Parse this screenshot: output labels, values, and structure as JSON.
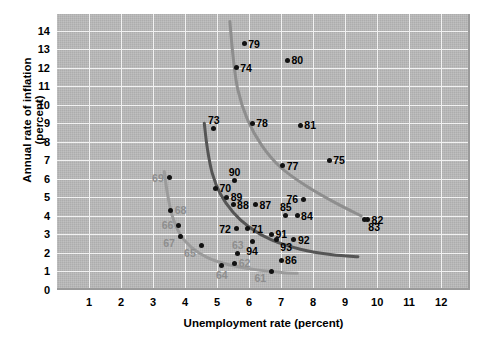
{
  "chart_data": {
    "type": "scatter",
    "title": "",
    "xlabel": "Unemployment rate (percent)",
    "ylabel": "Annual rate of inflation (percent)",
    "xlim": [
      0,
      12.9
    ],
    "ylim": [
      0,
      14.9
    ],
    "xticks": [
      1,
      2,
      3,
      4,
      5,
      6,
      7,
      8,
      9,
      10,
      11,
      12
    ],
    "yticks": [
      0,
      1,
      2,
      3,
      4,
      5,
      6,
      7,
      8,
      9,
      10,
      11,
      12,
      13,
      14
    ],
    "grid": true,
    "legend": "none",
    "points": [
      {
        "label": "61",
        "x": 6.7,
        "y": 1.0,
        "label_color": "gray",
        "label_pos": "below-left"
      },
      {
        "label": "62",
        "x": 5.55,
        "y": 1.45,
        "label_color": "gray",
        "label_pos": "right"
      },
      {
        "label": "63",
        "x": 5.65,
        "y": 1.95,
        "label_color": "gray",
        "label_pos": "above"
      },
      {
        "label": "64",
        "x": 5.15,
        "y": 1.3,
        "label_color": "gray",
        "label_pos": "below"
      },
      {
        "label": "65",
        "x": 4.5,
        "y": 2.4,
        "label_color": "gray",
        "label_pos": "below-left"
      },
      {
        "label": "66",
        "x": 3.8,
        "y": 3.5,
        "label_color": "gray",
        "label_pos": "left"
      },
      {
        "label": "67",
        "x": 3.85,
        "y": 2.9,
        "label_color": "gray",
        "label_pos": "below-left"
      },
      {
        "label": "68",
        "x": 3.55,
        "y": 4.3,
        "label_color": "gray",
        "label_pos": "right"
      },
      {
        "label": "69",
        "x": 3.5,
        "y": 6.05,
        "label_color": "gray",
        "label_pos": "left"
      },
      {
        "label": "70",
        "x": 4.95,
        "y": 5.5,
        "label_color": "black",
        "label_pos": "right"
      },
      {
        "label": "71",
        "x": 5.95,
        "y": 3.3,
        "label_color": "black",
        "label_pos": "right"
      },
      {
        "label": "72",
        "x": 5.6,
        "y": 3.3,
        "label_color": "black",
        "label_pos": "left"
      },
      {
        "label": "73",
        "x": 4.9,
        "y": 8.7,
        "label_color": "black",
        "label_pos": "above"
      },
      {
        "label": "74",
        "x": 5.6,
        "y": 12.0,
        "label_color": "black",
        "label_pos": "right"
      },
      {
        "label": "75",
        "x": 8.5,
        "y": 7.0,
        "label_color": "black",
        "label_pos": "right"
      },
      {
        "label": "76",
        "x": 7.7,
        "y": 4.9,
        "label_color": "black",
        "label_pos": "left"
      },
      {
        "label": "77",
        "x": 7.05,
        "y": 6.7,
        "label_color": "black",
        "label_pos": "right"
      },
      {
        "label": "78",
        "x": 6.1,
        "y": 9.0,
        "label_color": "black",
        "label_pos": "right"
      },
      {
        "label": "79",
        "x": 5.85,
        "y": 13.3,
        "label_color": "black",
        "label_pos": "right"
      },
      {
        "label": "80",
        "x": 7.2,
        "y": 12.4,
        "label_color": "black",
        "label_pos": "right"
      },
      {
        "label": "81",
        "x": 7.6,
        "y": 8.9,
        "label_color": "black",
        "label_pos": "right"
      },
      {
        "label": "82",
        "x": 9.7,
        "y": 3.8,
        "label_color": "black",
        "label_pos": "right"
      },
      {
        "label": "83",
        "x": 9.6,
        "y": 3.8,
        "label_color": "black",
        "label_pos": "right-below"
      },
      {
        "label": "84",
        "x": 7.5,
        "y": 4.0,
        "label_color": "black",
        "label_pos": "right"
      },
      {
        "label": "85",
        "x": 7.15,
        "y": 4.0,
        "label_color": "black",
        "label_pos": "above"
      },
      {
        "label": "86",
        "x": 7.0,
        "y": 1.6,
        "label_color": "black",
        "label_pos": "right"
      },
      {
        "label": "87",
        "x": 6.2,
        "y": 4.6,
        "label_color": "black",
        "label_pos": "right"
      },
      {
        "label": "88",
        "x": 5.5,
        "y": 4.6,
        "label_color": "black",
        "label_pos": "right"
      },
      {
        "label": "89",
        "x": 5.3,
        "y": 5.0,
        "label_color": "black",
        "label_pos": "right"
      },
      {
        "label": "90",
        "x": 5.55,
        "y": 5.9,
        "label_color": "black",
        "label_pos": "above"
      },
      {
        "label": "91",
        "x": 6.7,
        "y": 3.0,
        "label_color": "black",
        "label_pos": "right"
      },
      {
        "label": "92",
        "x": 7.4,
        "y": 2.7,
        "label_color": "black",
        "label_pos": "right"
      },
      {
        "label": "93",
        "x": 6.85,
        "y": 2.7,
        "label_color": "black",
        "label_pos": "right-below"
      },
      {
        "label": "94",
        "x": 6.1,
        "y": 2.6,
        "label_color": "black",
        "label_pos": "below"
      }
    ],
    "curves": [
      {
        "name": "phillips-curve-1960s",
        "color": "#9b9b9b",
        "width": 3.0,
        "points": [
          [
            3.35,
            6.4
          ],
          [
            3.45,
            5.2
          ],
          [
            3.6,
            4.0
          ],
          [
            3.85,
            3.0
          ],
          [
            4.2,
            2.3
          ],
          [
            4.7,
            1.75
          ],
          [
            5.4,
            1.35
          ],
          [
            6.2,
            1.1
          ],
          [
            7.0,
            0.95
          ],
          [
            7.5,
            0.9
          ]
        ]
      },
      {
        "name": "phillips-curve-1970s",
        "color": "#555555",
        "width": 3.0,
        "points": [
          [
            4.6,
            9.0
          ],
          [
            4.7,
            7.6
          ],
          [
            4.85,
            6.3
          ],
          [
            5.1,
            5.2
          ],
          [
            5.5,
            4.2
          ],
          [
            6.0,
            3.4
          ],
          [
            6.7,
            2.7
          ],
          [
            7.6,
            2.2
          ],
          [
            8.6,
            1.9
          ],
          [
            9.4,
            1.8
          ]
        ]
      },
      {
        "name": "phillips-curve-1980s",
        "color": "#8e8e8e",
        "width": 3.0,
        "points": [
          [
            5.4,
            14.5
          ],
          [
            5.5,
            12.6
          ],
          [
            5.65,
            10.8
          ],
          [
            5.95,
            9.2
          ],
          [
            6.4,
            7.8
          ],
          [
            7.0,
            6.6
          ],
          [
            7.8,
            5.6
          ],
          [
            8.7,
            4.7
          ],
          [
            9.5,
            4.0
          ]
        ]
      }
    ]
  }
}
